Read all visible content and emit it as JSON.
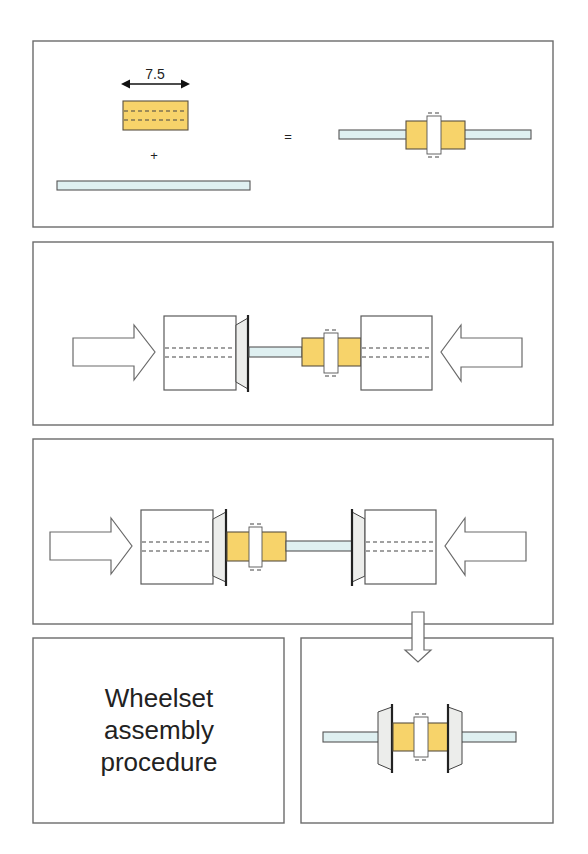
{
  "title": "Wheelset assembly procedure",
  "caption_lines": [
    "Wheelset",
    "assembly",
    "procedure"
  ],
  "colors": {
    "sleeve": "#f7d36a",
    "axle": "#dff0f1",
    "wheel": "#ecedeb",
    "outline": "#6b6b6b"
  },
  "step1": {
    "dimension_label": "7.5",
    "plus_sign": "+",
    "equals_sign": "=",
    "parts": [
      "gear sleeve",
      "axle"
    ],
    "result": "axle with gear sleeve"
  },
  "step2": {
    "description": "Press first wheel onto axle using press blocks",
    "arrows": [
      "right",
      "left"
    ]
  },
  "step3": {
    "description": "Press second wheel onto axle using press blocks",
    "arrows": [
      "right",
      "left"
    ],
    "next_arrow": "down"
  },
  "step4": {
    "description": "Completed wheelset"
  }
}
